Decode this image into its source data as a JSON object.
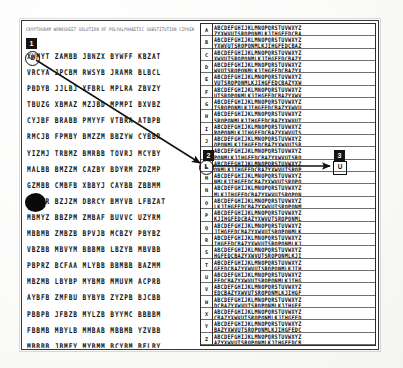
{
  "figure": {
    "kind": "scanned-cryptanalysis-worksheet",
    "ink_color": "#141414",
    "paper_color": "#ffffff",
    "frame_color": "#3a3a3a"
  },
  "cipher_pane": {
    "header_line": "CRYPTOGRAM WORKSHEET  SOLUTION OF POLYALPHABETIC SUBSTITUTION CIPHER",
    "rows": [
      "XWMYT ZAMBB JBNZX BYWFF KBZAT",
      "VRCYA JPCBM RWSYB JRAMR BLBCL",
      "PBDYB JJLBJ XFBRL MPLRA ZBVZY",
      "TBUZG XBMAZ MZJBD MPMPI BXVBZ",
      "CYJBF BRABB PMYYF VTBRA ATBPB",
      "RMCJB FPMBY BMZZM BBZYW CYBBR",
      "YIZMJ TRBMZ BMRBB TOVRJ MCYBY",
      "MALBB BMZZM CAZBY BDYRM ZDZMP",
      "GZMBB CMBFB XBBYJ CAYBB ZBBMM",
      "BRBZR BZJZM DBRCY BMYVB LFBZAT",
      "MBMYZ BBZPM ZMBAF BUVVC UZYRM",
      "MBBMB ZMBZB BPVJB MCBZY PBYBZ",
      "VBZBB MBVYM BBBMB LBZYB MBVBB",
      "PBPRZ BCFAA MLYBB BBMBB BAZMM",
      "MBZMB LBYBP MYBMB MMUVM ACPRB",
      "AYBFB ZMFBU BYBYB ZYZPB BJCBB",
      "PBBPB JFBZB MYLZB BYYMC BBBBM",
      "FBBMB MBYLB MMBAB MBBMB YZVBB",
      "MBBBB JBMFY MYBMM BCYBM BFLBY"
    ],
    "group_size": 5,
    "groups_per_row": 5
  },
  "tableau": {
    "row_labels": [
      "A",
      "B",
      "C",
      "D",
      "E",
      "F",
      "G",
      "H",
      "I",
      "J",
      "K",
      "L",
      "M",
      "N",
      "O",
      "P",
      "Q",
      "R",
      "S",
      "T",
      "U",
      "V",
      "W",
      "X",
      "Y",
      "Z"
    ],
    "alphabet": "ABCDEFGHIJKLMNOPQRSTUVWXYZ",
    "reversed_alphabet": "ZYXWVUTSRQPONMLKJIHGFEDCBA",
    "row_pairs": [
      {
        "label": "A",
        "line1": "ABCDEFGHIJKLMNOPQRSTUVWXYZ",
        "line2": "ZYXWVUTSRQPONMLKJIHGFEDCBA"
      },
      {
        "label": "B",
        "line1": "ABCDEFGHIJKLMNOPQRSTUVWXYZ",
        "line2": "YXWVUTSRQPONMLKJIHGFEDCBAZ"
      },
      {
        "label": "C",
        "line1": "ABCDEFGHIJKLMNOPQRSTUVWXYZ",
        "line2": "XWVUTSRQPONMLKJIHGFEDCBAZY"
      },
      {
        "label": "D",
        "line1": "ABCDEFGHIJKLMNOPQRSTUVWXYZ",
        "line2": "WVUTSRQPONMLKJIHGFEDCBAZYX"
      },
      {
        "label": "E",
        "line1": "ABCDEFGHIJKLMNOPQRSTUVWXYZ",
        "line2": "VUTSRQPONMLKJIHGFEDCBAZYXW"
      },
      {
        "label": "F",
        "line1": "ABCDEFGHIJKLMNOPQRSTUVWXYZ",
        "line2": "UTSRQPONMLKJIHGFEDCBAZYXWV"
      },
      {
        "label": "G",
        "line1": "ABCDEFGHIJKLMNOPQRSTUVWXYZ",
        "line2": "TSRQPONMLKJIHGFEDCBAZYXWVU"
      },
      {
        "label": "H",
        "line1": "ABCDEFGHIJKLMNOPQRSTUVWXYZ",
        "line2": "SRQPONMLKJIHGFEDCBAZYXWVUT"
      },
      {
        "label": "I",
        "line1": "ABCDEFGHIJKLMNOPQRSTUVWXYZ",
        "line2": "RQPONMLKJIHGFEDCBAZYXWVUTS"
      },
      {
        "label": "J",
        "line1": "ABCDEFGHIJKLMNOPQRSTUVWXYZ",
        "line2": "QPONMLKJIHGFEDCBAZYXWVUTSR"
      },
      {
        "label": "K",
        "line1": "ABCDEFGHIJKLMNOPQRSTUVWXYZ",
        "line2": "PONMLKJIHGFEDCBAZYXWVUTSRQ"
      },
      {
        "label": "L",
        "line1": "ABCDEFGHIJKLMNOPQRSTUVWXYZ",
        "line2": "ONMLKJIHGFEDCBAZYXWVUTSRQP"
      },
      {
        "label": "M",
        "line1": "ABCDEFGHIJKLMNOPQRSTUVWXYZ",
        "line2": "NMLKJIHGFEDCBAZYXWVUTSRQPO"
      },
      {
        "label": "N",
        "line1": "ABCDEFGHIJKLMNOPQRSTUVWXYZ",
        "line2": "MLKJIHGFEDCBAZYXWVUTSRQPON"
      },
      {
        "label": "O",
        "line1": "ABCDEFGHIJKLMNOPQRSTUVWXYZ",
        "line2": "LKJIHGFEDCBAZYXWVUTSRQPONM"
      },
      {
        "label": "P",
        "line1": "ABCDEFGHIJKLMNOPQRSTUVWXYZ",
        "line2": "KJIHGFEDCBAZYXWVUTSRQPONML"
      },
      {
        "label": "Q",
        "line1": "ABCDEFGHIJKLMNOPQRSTUVWXYZ",
        "line2": "JIHGFEDCBAZYXWVUTSRQPONMLK"
      },
      {
        "label": "R",
        "line1": "ABCDEFGHIJKLMNOPQRSTUVWXYZ",
        "line2": "IHGFEDCBAZYXWVUTSRQPONMLKJ"
      },
      {
        "label": "S",
        "line1": "ABCDEFGHIJKLMNOPQRSTUVWXYZ",
        "line2": "HGFEDCBAZYXWVUTSRQPONMLKJI"
      },
      {
        "label": "T",
        "line1": "ABCDEFGHIJKLMNOPQRSTUVWXYZ",
        "line2": "GFEDCBAZYXWVUTSRQPONMLKJIH"
      },
      {
        "label": "U",
        "line1": "ABCDEFGHIJKLMNOPQRSTUVWXYZ",
        "line2": "FEDCBAZYXWVUTSRQPONMLKJIHG"
      },
      {
        "label": "V",
        "line1": "ABCDEFGHIJKLMNOPQRSTUVWXYZ",
        "line2": "EDCBAZYXWVUTSRQPONMLKJIHGF"
      },
      {
        "label": "W",
        "line1": "ABCDEFGHIJKLMNOPQRSTUVWXYZ",
        "line2": "DCBAZYXWVUTSRQPONMLKJIHGFE"
      },
      {
        "label": "X",
        "line1": "ABCDEFGHIJKLMNOPQRSTUVWXYZ",
        "line2": "CBAZYXWVUTSRQPONMLKJIHGFED"
      },
      {
        "label": "Y",
        "line1": "ABCDEFGHIJKLMNOPQRSTUVWXYZ",
        "line2": "BAZYXWVUTSRQPONMLKJIHGFEDC"
      },
      {
        "label": "Z",
        "line1": "ABCDEFGHIJKLMNOPQRSTUVWXYZ",
        "line2": "AZYXWVUTSRQPONMLKJIHGFEDCB"
      }
    ]
  },
  "annotations": {
    "marker_1": {
      "number": "1",
      "letter": "L"
    },
    "marker_2": {
      "number": "2",
      "letter": "L"
    },
    "marker_3": {
      "number": "3",
      "letter": "U"
    },
    "arrow_diagonal": {
      "from": "marker-1",
      "to": "marker-2"
    },
    "arrow_horizontal": {
      "from": "marker-2",
      "to": "marker-3"
    },
    "ink_blob": "ink-blot"
  }
}
